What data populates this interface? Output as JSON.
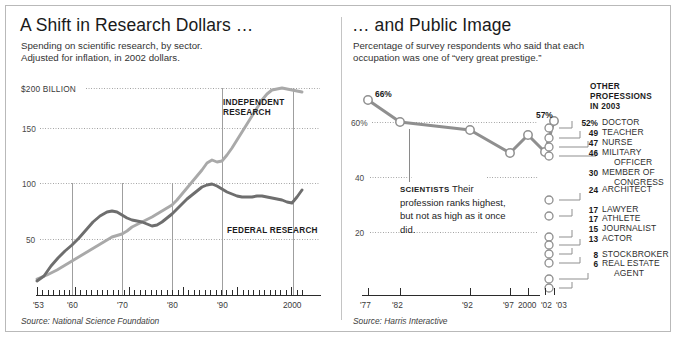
{
  "left_panel": {
    "title": "A Shift in Research Dollars …",
    "subtitle_line1": "Spending on scientific research, by sector.",
    "subtitle_line2": "Adjusted for inflation, in 2002 dollars.",
    "source": "Source: National Science Foundation",
    "label_independent": "INDEPENDENT\nRESEARCH",
    "label_independent_l1": "INDEPENDENT",
    "label_independent_l2": "RESEARCH",
    "label_federal": "FEDERAL RESEARCH",
    "y_top_label": "$200 BILLION",
    "y_labels": [
      "150",
      "100",
      "50"
    ],
    "x_labels": [
      "'53",
      "'60",
      "'70",
      "'80",
      "'90",
      "2000"
    ],
    "color_federal": "#6e6e6e",
    "color_independent": "#a9a9a9"
  },
  "right_panel": {
    "title": "… and Public Image",
    "subtitle_line1": "Percentage of survey respondents who said that each",
    "subtitle_line2": "occupation was one of “very great prestige.”",
    "source": "Source: Harris Interactive",
    "callout_lead": "SCIENTISTS",
    "callout_text": "Their profession ranks highest, but not as high as it once did.",
    "start_label": "66%",
    "end_label": "57%",
    "y_labels": [
      "60%",
      "40",
      "20"
    ],
    "x_labels": [
      "'77",
      "'82",
      "'92",
      "'97",
      "2000",
      "'02",
      "'03"
    ],
    "others_title_l1": "OTHER",
    "others_title_l2": "PROFESSIONS",
    "others_title_l3": "IN 2003",
    "color_line": "#8f8f8f"
  },
  "chart_data": [
    {
      "type": "line",
      "title": "A Shift in Research Dollars …",
      "subtitle": "Spending on scientific research, by sector. Adjusted for inflation, in 2002 dollars.",
      "xlabel": "",
      "ylabel": "$ Billions (2002 dollars)",
      "ylim": [
        0,
        200
      ],
      "xlim": [
        1953,
        2002
      ],
      "grid": true,
      "gridlines": [
        200,
        150,
        100,
        50
      ],
      "xticks": [
        1953,
        1960,
        1970,
        1980,
        1990,
        2000
      ],
      "xticklabels": [
        "'53",
        "'60",
        "'70",
        "'80",
        "'90",
        "2000"
      ],
      "legend": "inline-labels",
      "source": "Source: National Science Foundation",
      "x": [
        1953,
        1955,
        1957,
        1959,
        1961,
        1963,
        1965,
        1967,
        1969,
        1971,
        1973,
        1975,
        1977,
        1979,
        1981,
        1983,
        1985,
        1987,
        1989,
        1991,
        1993,
        1995,
        1997,
        1999,
        2000,
        2001,
        2002
      ],
      "series": [
        {
          "name": "FEDERAL RESEARCH",
          "color": "#6e6e6e",
          "values": [
            15,
            20,
            30,
            40,
            50,
            58,
            63,
            66,
            65,
            60,
            56,
            54,
            57,
            61,
            66,
            72,
            80,
            86,
            85,
            82,
            79,
            77,
            77,
            78,
            78,
            82,
            88
          ]
        },
        {
          "name": "INDEPENDENT RESEARCH",
          "color": "#a9a9a9",
          "values": [
            14,
            18,
            22,
            27,
            32,
            37,
            42,
            47,
            49,
            48,
            50,
            53,
            58,
            62,
            70,
            79,
            90,
            99,
            103,
            102,
            107,
            118,
            133,
            152,
            172,
            193,
            190
          ]
        }
      ]
    },
    {
      "type": "line",
      "title": "… and Public Image",
      "subtitle": "Percentage of survey respondents who said that each occupation was one of “very great prestige.”",
      "xlabel": "",
      "ylabel": "Percent",
      "ylim": [
        0,
        70
      ],
      "grid": true,
      "gridlines": [
        60,
        40,
        20
      ],
      "source": "Source: Harris Interactive",
      "legend": "none",
      "x": [
        "'77",
        "'82",
        "'92",
        "'97",
        "2000",
        "'02",
        "'03"
      ],
      "series": [
        {
          "name": "SCIENTISTS",
          "color": "#8f8f8f",
          "values": [
            66,
            60,
            57,
            51,
            56,
            51,
            57
          ]
        }
      ],
      "annotations": [
        {
          "text": "66%",
          "x": "'77",
          "y": 66
        },
        {
          "text": "57%",
          "x": "'03",
          "y": 57
        }
      ]
    },
    {
      "type": "bar",
      "title": "OTHER PROFESSIONS IN 2003",
      "xlabel": "",
      "ylabel": "",
      "categories": [
        "DOCTOR",
        "TEACHER",
        "NURSE",
        "MILITARY OFFICER",
        "MEMBER OF CONGRESS",
        "ARCHITECT",
        "LAWYER",
        "ATHLETE",
        "JOURNALIST",
        "ACTOR",
        "STOCKBROKER",
        "REAL ESTATE AGENT"
      ],
      "values": [
        52,
        49,
        47,
        46,
        30,
        24,
        17,
        17,
        15,
        13,
        8,
        6
      ],
      "value_labels": [
        "52%",
        "49",
        "47",
        "46",
        "30",
        "24",
        "17",
        "17",
        "15",
        "13",
        "8",
        "6"
      ]
    }
  ],
  "others": [
    {
      "value": "52%",
      "name_l1": "DOCTOR",
      "name_l2": ""
    },
    {
      "value": "49",
      "name_l1": "TEACHER",
      "name_l2": ""
    },
    {
      "value": "47",
      "name_l1": "NURSE",
      "name_l2": ""
    },
    {
      "value": "46",
      "name_l1": "MILITARY",
      "name_l2": "OFFICER"
    },
    {
      "value": "30",
      "name_l1": "MEMBER OF",
      "name_l2": "CONGRESS"
    },
    {
      "value": "24",
      "name_l1": "ARCHITECT",
      "name_l2": ""
    },
    {
      "value": "17",
      "name_l1": "LAWYER",
      "name_l2": ""
    },
    {
      "value": "17",
      "name_l1": "ATHLETE",
      "name_l2": ""
    },
    {
      "value": "15",
      "name_l1": "JOURNALIST",
      "name_l2": ""
    },
    {
      "value": "13",
      "name_l1": "ACTOR",
      "name_l2": ""
    },
    {
      "value": "8",
      "name_l1": "STOCKBROKER",
      "name_l2": ""
    },
    {
      "value": "6",
      "name_l1": "REAL ESTATE",
      "name_l2": "AGENT"
    }
  ]
}
